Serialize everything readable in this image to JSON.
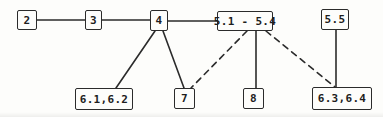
{
  "figure": {
    "kind": "graph-diagram",
    "background": "#fdfdfb",
    "line_color": "#2b2b2b",
    "text_color": "#1e1e1e"
  },
  "diagram": {
    "nodes": [
      {
        "id": "2",
        "label": "2",
        "x": 17,
        "y": 10,
        "w": 20,
        "h": 20
      },
      {
        "id": "3",
        "label": "3",
        "x": 85,
        "y": 10,
        "w": 17,
        "h": 20
      },
      {
        "id": "4",
        "label": "4",
        "x": 150,
        "y": 10,
        "w": 18,
        "h": 21
      },
      {
        "id": "5.1-5.4",
        "label": "5.1 - 5.4",
        "x": 217,
        "y": 11,
        "w": 56,
        "h": 20
      },
      {
        "id": "5.5",
        "label": "5.5",
        "x": 321,
        "y": 9,
        "w": 28,
        "h": 21
      },
      {
        "id": "6.1-6.2",
        "label": "6.1,6.2",
        "x": 75,
        "y": 88,
        "w": 58,
        "h": 22
      },
      {
        "id": "7",
        "label": "7",
        "x": 174,
        "y": 88,
        "w": 21,
        "h": 21
      },
      {
        "id": "8",
        "label": "8",
        "x": 243,
        "y": 88,
        "w": 21,
        "h": 21
      },
      {
        "id": "6.3-6.4",
        "label": "6.3,6.4",
        "x": 312,
        "y": 87,
        "w": 60,
        "h": 23
      }
    ],
    "edges": [
      {
        "from": "2",
        "to": "3",
        "style": "solid",
        "x1": 37,
        "y1": 20,
        "x2": 85,
        "y2": 20
      },
      {
        "from": "3",
        "to": "4",
        "style": "solid",
        "x1": 102,
        "y1": 20,
        "x2": 150,
        "y2": 20
      },
      {
        "from": "4",
        "to": "5.1-5.4",
        "style": "solid",
        "x1": 168,
        "y1": 21,
        "x2": 217,
        "y2": 21
      },
      {
        "from": "4",
        "to": "6.1-6.2",
        "style": "solid",
        "x1": 155,
        "y1": 31,
        "x2": 116,
        "y2": 88
      },
      {
        "from": "4",
        "to": "7",
        "style": "solid",
        "x1": 163,
        "y1": 31,
        "x2": 184,
        "y2": 88
      },
      {
        "from": "5.1-5.4",
        "to": "7",
        "style": "dashed",
        "x1": 247,
        "y1": 31,
        "x2": 191,
        "y2": 88
      },
      {
        "from": "5.1-5.4",
        "to": "8",
        "style": "solid",
        "x1": 256,
        "y1": 31,
        "x2": 256,
        "y2": 88
      },
      {
        "from": "5.1-5.4",
        "to": "6.3-6.4",
        "style": "dashed",
        "x1": 266,
        "y1": 31,
        "x2": 335,
        "y2": 87
      },
      {
        "from": "5.5",
        "to": "6.3-6.4",
        "style": "solid",
        "x1": 336,
        "y1": 30,
        "x2": 336,
        "y2": 87
      }
    ]
  }
}
